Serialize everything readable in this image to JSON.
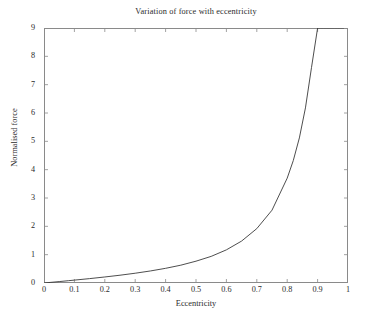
{
  "chart_data": {
    "type": "line",
    "title": "Variation of force with eccentricity",
    "xlabel": "Eccentricity",
    "ylabel": "Normalised force",
    "xlim": [
      0,
      1
    ],
    "ylim": [
      0,
      9
    ],
    "grid": false,
    "legend": null,
    "xticks": [
      "0",
      "0.1",
      "0.2",
      "0.3",
      "0.4",
      "0.5",
      "0.6",
      "0.7",
      "0.8",
      "0.9",
      "1"
    ],
    "xtick_values": [
      0,
      0.1,
      0.2,
      0.3,
      0.4,
      0.5,
      0.6,
      0.7,
      0.8,
      0.9,
      1
    ],
    "yticks": [
      "0",
      "1",
      "2",
      "3",
      "4",
      "5",
      "6",
      "7",
      "8",
      "9"
    ],
    "ytick_values": [
      0,
      1,
      2,
      3,
      4,
      5,
      6,
      7,
      8,
      9
    ],
    "line_color": "#3a3a3a",
    "line_width": 0.9,
    "series": [
      {
        "name": "Normalised force",
        "x": [
          0,
          0.02,
          0.05,
          0.08,
          0.1,
          0.15,
          0.2,
          0.25,
          0.3,
          0.35,
          0.4,
          0.45,
          0.5,
          0.55,
          0.6,
          0.65,
          0.7,
          0.75,
          0.8,
          0.82,
          0.84,
          0.86,
          0.88,
          0.9,
          0.91,
          0.92,
          0.93,
          0.94,
          0.95,
          0.955,
          0.96,
          0.965,
          0.97,
          0.973,
          0.976,
          0.978,
          0.98,
          0.981,
          0.982,
          0.983,
          0.984,
          0.9845,
          0.985,
          0.9853
        ],
        "y": [
          0,
          0.02,
          0.05,
          0.081,
          0.102,
          0.155,
          0.213,
          0.275,
          0.345,
          0.425,
          0.518,
          0.629,
          0.77,
          0.94,
          1.17,
          1.48,
          1.92,
          2.57,
          3.7,
          4.32,
          5.12,
          6.18,
          7.61,
          9.0,
          9.0,
          9.0,
          9.0,
          9.0,
          9.0,
          9.0,
          9.0,
          9.0,
          9.0,
          9.0,
          9.0,
          9.0,
          9.0,
          9.0,
          9.0,
          9.0,
          9.0,
          9.0,
          9.0,
          9.0
        ]
      }
    ],
    "curve_formula_note": "e/(1-e^2)^1.5"
  },
  "axes": {
    "frame_color": "#8a8a8a",
    "background": "#ffffff"
  }
}
